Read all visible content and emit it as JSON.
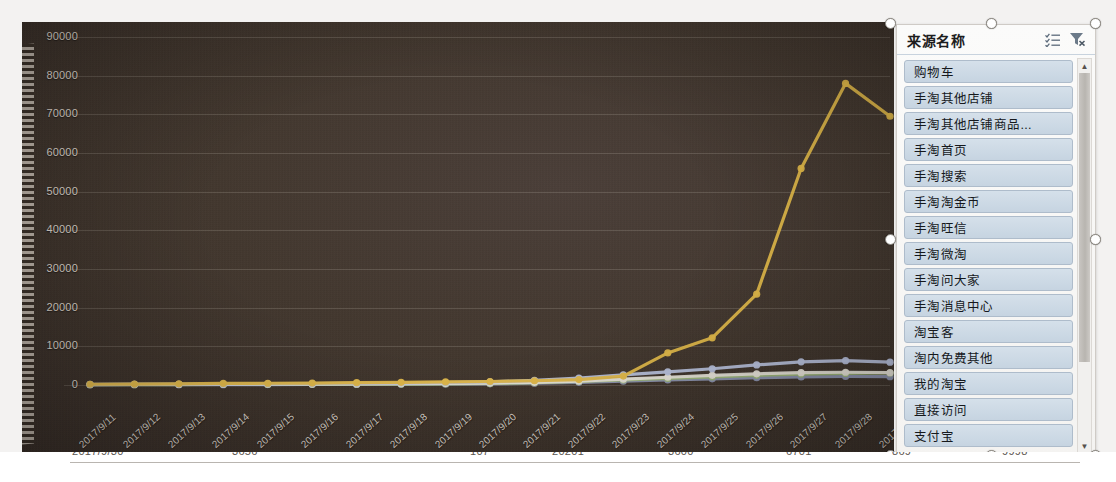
{
  "chart_data": {
    "type": "line",
    "title": "",
    "xlabel": "",
    "ylabel": "",
    "ylim": [
      0,
      90000
    ],
    "grid": true,
    "legend_position": "right",
    "x": [
      "2017/9/11",
      "2017/9/12",
      "2017/9/13",
      "2017/9/14",
      "2017/9/15",
      "2017/9/16",
      "2017/9/17",
      "2017/9/18",
      "2017/9/19",
      "2017/9/20",
      "2017/9/21",
      "2017/9/22",
      "2017/9/23",
      "2017/9/24",
      "2017/9/25",
      "2017/9/26",
      "2017/9/27",
      "2017/9/28",
      "2017/9/29"
    ],
    "ytick_labels": [
      "90000",
      "80000",
      "70000",
      "60000",
      "50000",
      "40000",
      "30000",
      "20000",
      "10000",
      "0"
    ],
    "ytick_values": [
      90000,
      80000,
      70000,
      60000,
      50000,
      40000,
      30000,
      20000,
      10000,
      0
    ],
    "series": [
      {
        "name": "手淘搜索",
        "color": "#e0b84a",
        "values": [
          200,
          250,
          300,
          400,
          450,
          500,
          600,
          700,
          800,
          900,
          1100,
          1400,
          2300,
          8300,
          12200,
          23500,
          56000,
          78000,
          69500
        ]
      },
      {
        "name": "手淘首页",
        "color": "#b9c2dd",
        "values": [
          150,
          180,
          200,
          250,
          300,
          350,
          420,
          500,
          600,
          800,
          1200,
          1800,
          2600,
          3400,
          4200,
          5200,
          6000,
          6300,
          5900
        ]
      },
      {
        "name": "购物车",
        "color": "#e8e4da",
        "values": [
          120,
          140,
          160,
          180,
          200,
          240,
          280,
          330,
          400,
          500,
          700,
          1000,
          1500,
          2000,
          2500,
          2900,
          3200,
          3300,
          3200
        ]
      },
      {
        "name": "淘宝客",
        "color": "#9fb87a",
        "values": [
          80,
          90,
          110,
          130,
          150,
          180,
          210,
          250,
          300,
          400,
          600,
          900,
          1300,
          1700,
          2100,
          2500,
          2800,
          3000,
          3100
        ]
      },
      {
        "name": "直接访问",
        "color": "#8f97b3",
        "values": [
          60,
          70,
          80,
          95,
          110,
          130,
          150,
          180,
          220,
          300,
          450,
          700,
          1000,
          1300,
          1600,
          1900,
          2100,
          2200,
          2150
        ]
      }
    ]
  },
  "legend": {
    "title": "来源名称",
    "sort_icon": "sort-list-icon",
    "filter_icon": "clear-filter-icon",
    "items": [
      "购物车",
      "手淘其他店铺",
      "手淘其他店铺商品...",
      "手淘首页",
      "手淘搜索",
      "手淘淘金币",
      "手淘旺信",
      "手淘微淘",
      "手淘问大家",
      "手淘消息中心",
      "淘宝客",
      "淘内免费其他",
      "我的淘宝",
      "直接访问",
      "支付宝"
    ],
    "scroll_up_icon": "chevron-up-icon",
    "scroll_down_icon": "chevron-down-icon"
  },
  "bottom_row": {
    "cells": [
      {
        "text": "2017/9/30",
        "left": 72,
        "width": 130
      },
      {
        "text": "3656",
        "left": 232,
        "width": 90
      },
      {
        "text": "107",
        "left": 470,
        "width": 70
      },
      {
        "text": "20201",
        "left": 552,
        "width": 90
      },
      {
        "text": "3600",
        "left": 668,
        "width": 90
      },
      {
        "text": "6701",
        "left": 786,
        "width": 90
      },
      {
        "text": "869",
        "left": 892,
        "width": 80
      },
      {
        "text": "9998",
        "left": 1002,
        "width": 80
      }
    ]
  }
}
